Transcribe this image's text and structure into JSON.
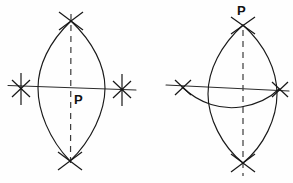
{
  "figure": {
    "background_color": "#fefefe",
    "ink_color": "#1a1a1a",
    "dash_color": "#3a3a3a",
    "labels": {
      "left_point": "P",
      "right_point": "P"
    },
    "panels": [
      {
        "id": "left-construction",
        "name": "perpendicular-at-point-on-line",
        "point_label": "P",
        "point_label_position": "below-right-of-center",
        "baseline": {
          "x1": 8,
          "y1": 86,
          "x2": 136,
          "y2": 90
        },
        "center": {
          "x": 71,
          "y": 88
        },
        "vesica": {
          "top": {
            "x": 71,
            "y": 21
          },
          "bottom": {
            "x": 70,
            "y": 161
          },
          "left_extent": {
            "x": 38,
            "y": 88
          },
          "right_extent": {
            "x": 105,
            "y": 88
          }
        },
        "arc_marks": [
          {
            "name": "arc-mark-top",
            "x": 71,
            "y": 21
          },
          {
            "name": "arc-mark-bottom",
            "x": 70,
            "y": 161
          },
          {
            "name": "arc-mark-left",
            "x": 21,
            "y": 88
          },
          {
            "name": "arc-mark-right",
            "x": 122,
            "y": 89
          }
        ],
        "dashed_axis": {
          "x": 71,
          "y1": 14,
          "y2": 167
        }
      },
      {
        "id": "right-construction",
        "name": "perpendicular-from-point-off-line",
        "point_label": "P",
        "point_label_position": "above-top-vertex",
        "baseline": {
          "x1": 166,
          "y1": 85,
          "x2": 289,
          "y2": 91
        },
        "center": {
          "x": 243,
          "y": 88
        },
        "vesica": {
          "top": {
            "x": 243,
            "y": 25
          },
          "bottom": {
            "x": 243,
            "y": 163
          },
          "left_extent": {
            "x": 208,
            "y": 94
          },
          "right_extent": {
            "x": 277,
            "y": 94
          }
        },
        "swing_arc": {
          "name": "swing-arc-through-intersections",
          "from": {
            "x": 182,
            "y": 87
          },
          "to": {
            "x": 279,
            "y": 89
          },
          "sag_point": {
            "x": 238,
            "y": 107
          }
        },
        "arc_marks": [
          {
            "name": "arc-mark-top",
            "x": 243,
            "y": 25
          },
          {
            "name": "arc-mark-bottom",
            "x": 243,
            "y": 163
          },
          {
            "name": "arc-mark-left",
            "x": 182,
            "y": 87
          },
          {
            "name": "arc-mark-right",
            "x": 279,
            "y": 89
          }
        ],
        "dashed_axis": {
          "x": 243,
          "y1": 30,
          "y2": 176
        }
      }
    ]
  }
}
